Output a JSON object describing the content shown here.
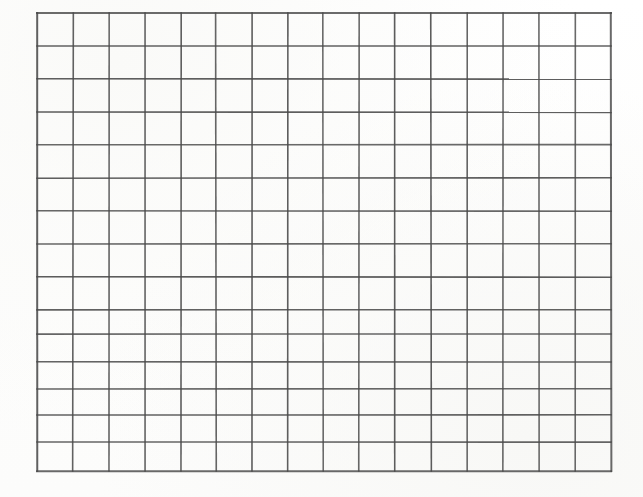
{
  "document": {
    "type": "blank-grid-worksheet",
    "title": "Blank Grid",
    "description": "Scanned blank rectangular grid worksheet with no text or data",
    "background_color": "#fefefe",
    "line_color": "#4a4a4a",
    "line_width_px": 1.6
  },
  "grid": {
    "columns": 16,
    "rows": 14,
    "left_px": 37,
    "top_px": 13,
    "right_px": 611,
    "bottom_px": 472,
    "width_px": 574,
    "height_px": 459,
    "cell_width_px": 35.9,
    "cell_height_px": 32.8,
    "column_x": [
      37,
      73,
      109,
      145,
      181,
      216,
      252,
      288,
      323,
      359,
      395,
      431,
      467,
      503,
      539,
      575,
      611
    ],
    "row_y": [
      13,
      46,
      79,
      112,
      145,
      178,
      211,
      244,
      277,
      310,
      334,
      362,
      389,
      415,
      442,
      471
    ],
    "cell_values": [
      [
        "",
        "",
        "",
        "",
        "",
        "",
        "",
        "",
        "",
        "",
        "",
        "",
        "",
        "",
        "",
        ""
      ],
      [
        "",
        "",
        "",
        "",
        "",
        "",
        "",
        "",
        "",
        "",
        "",
        "",
        "",
        "",
        "",
        ""
      ],
      [
        "",
        "",
        "",
        "",
        "",
        "",
        "",
        "",
        "",
        "",
        "",
        "",
        "",
        "",
        "",
        ""
      ],
      [
        "",
        "",
        "",
        "",
        "",
        "",
        "",
        "",
        "",
        "",
        "",
        "",
        "",
        "",
        "",
        ""
      ],
      [
        "",
        "",
        "",
        "",
        "",
        "",
        "",
        "",
        "",
        "",
        "",
        "",
        "",
        "",
        "",
        ""
      ],
      [
        "",
        "",
        "",
        "",
        "",
        "",
        "",
        "",
        "",
        "",
        "",
        "",
        "",
        "",
        "",
        ""
      ],
      [
        "",
        "",
        "",
        "",
        "",
        "",
        "",
        "",
        "",
        "",
        "",
        "",
        "",
        "",
        "",
        ""
      ],
      [
        "",
        "",
        "",
        "",
        "",
        "",
        "",
        "",
        "",
        "",
        "",
        "",
        "",
        "",
        "",
        ""
      ],
      [
        "",
        "",
        "",
        "",
        "",
        "",
        "",
        "",
        "",
        "",
        "",
        "",
        "",
        "",
        "",
        ""
      ],
      [
        "",
        "",
        "",
        "",
        "",
        "",
        "",
        "",
        "",
        "",
        "",
        "",
        "",
        "",
        "",
        ""
      ],
      [
        "",
        "",
        "",
        "",
        "",
        "",
        "",
        "",
        "",
        "",
        "",
        "",
        "",
        "",
        "",
        ""
      ],
      [
        "",
        "",
        "",
        "",
        "",
        "",
        "",
        "",
        "",
        "",
        "",
        "",
        "",
        "",
        "",
        ""
      ],
      [
        "",
        "",
        "",
        "",
        "",
        "",
        "",
        "",
        "",
        "",
        "",
        "",
        "",
        "",
        "",
        ""
      ],
      [
        "",
        "",
        "",
        "",
        "",
        "",
        "",
        "",
        "",
        "",
        "",
        "",
        "",
        "",
        "",
        ""
      ]
    ]
  }
}
